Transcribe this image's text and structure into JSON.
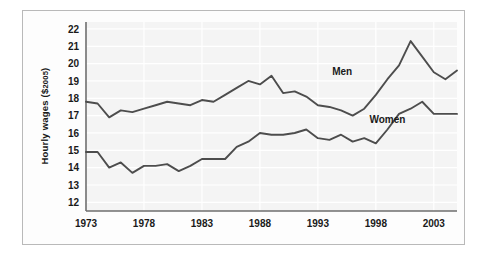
{
  "chart_data": {
    "type": "line",
    "title": "",
    "xlabel": "",
    "ylabel": "Hourly wages ($2005)",
    "ylabel_main": "Hourly wages (",
    "ylabel_currency": "$",
    "ylabel_year": "2005",
    "ylabel_close": ")",
    "xlim": [
      1973,
      2005
    ],
    "ylim": [
      11.5,
      22.4
    ],
    "grid": true,
    "legend_position": "inline-annotations",
    "yticks": [
      12,
      13,
      14,
      15,
      16,
      17,
      18,
      19,
      20,
      21,
      22
    ],
    "ytick_labels": [
      "12",
      "13",
      "14",
      "15",
      "16",
      "17",
      "18",
      "19",
      "20",
      "21",
      "22"
    ],
    "xticks": [
      1973,
      1978,
      1983,
      1988,
      1993,
      1998,
      2003
    ],
    "xtick_labels": [
      "1973",
      "1978",
      "1983",
      "1988",
      "1993",
      "1998",
      "2003"
    ],
    "x": [
      1973,
      1974,
      1975,
      1976,
      1977,
      1978,
      1979,
      1980,
      1981,
      1982,
      1983,
      1984,
      1985,
      1986,
      1987,
      1988,
      1989,
      1990,
      1991,
      1992,
      1993,
      1994,
      1995,
      1996,
      1997,
      1998,
      1999,
      2000,
      2001,
      2002,
      2003,
      2004,
      2005
    ],
    "series": [
      {
        "name": "Men",
        "color": "#4d4d4d",
        "label_x": 1995.1,
        "label_y": 19.35,
        "values": [
          17.8,
          17.7,
          16.9,
          17.3,
          17.2,
          17.4,
          17.6,
          17.8,
          17.7,
          17.6,
          17.9,
          17.8,
          18.2,
          18.6,
          19.0,
          18.8,
          19.3,
          18.3,
          18.4,
          18.1,
          17.6,
          17.5,
          17.3,
          17.0,
          17.4,
          18.2,
          19.1,
          19.9,
          21.3,
          20.4,
          19.5,
          19.1,
          19.6
        ]
      },
      {
        "name": "Women",
        "color": "#4d4d4d",
        "label_x": 1999.0,
        "label_y": 16.6,
        "values": [
          14.9,
          14.9,
          14.0,
          14.3,
          13.7,
          14.1,
          14.1,
          14.2,
          13.8,
          14.1,
          14.5,
          14.5,
          14.5,
          15.2,
          15.5,
          16.0,
          15.9,
          15.9,
          16.0,
          16.2,
          15.7,
          15.6,
          15.9,
          15.5,
          15.7,
          15.4,
          16.2,
          17.1,
          17.4,
          17.8,
          17.1,
          17.1,
          17.1
        ]
      }
    ]
  }
}
